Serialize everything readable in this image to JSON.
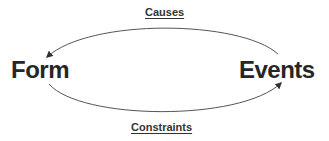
{
  "nodes": {
    "form": "Form",
    "events": "Events"
  },
  "edges": {
    "causes": "Causes",
    "constraints": "Constraints"
  },
  "colors": {
    "text": "#262626",
    "arc": "#555555",
    "background": "#ffffff"
  }
}
